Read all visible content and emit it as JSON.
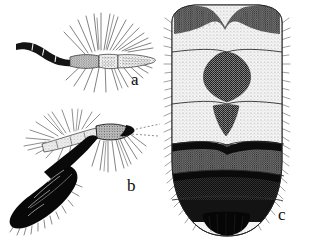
{
  "plate": {
    "title": "Entomological figure plate",
    "background_color": "#ffffff",
    "ink_color": "#111111",
    "width": 316,
    "height": 240,
    "style": "stippled pen-and-ink scientific illustration, grayscale"
  },
  "panels": [
    {
      "label": "a",
      "label_x": 131,
      "label_y": 80,
      "name": "figure-a-palpus",
      "description": "Lateral view of a maxillary palpus / antenna: dark curved segmented basal portion at left, pale grey stippled swollen segment, followed by two narrow pale segments bearing long radiating bristles directed upward and downward.",
      "bbox": [
        14,
        12,
        148,
        78
      ],
      "colors": {
        "dark": "#131313",
        "mid": "#6e6e6e",
        "pale": "#d8d8d8"
      }
    },
    {
      "label": "b",
      "label_x": 127,
      "label_y": 186,
      "name": "figure-b-palpus-dark",
      "description": "Angled palpus with very black elongate terminal lobe pointing down-left, a bent dark shaft, a grey stippled oval segment at the bend, and a slender pale flagellum with long fine hairs extending upper-left; a fan of fine hairs radiates below the oval segment.",
      "bbox": [
        14,
        110,
        150,
        228
      ],
      "colors": {
        "dark": "#0a0a0a",
        "mid": "#707070",
        "pale": "#cfcfcf"
      }
    },
    {
      "label": "c",
      "label_x": 278,
      "label_y": 215,
      "name": "figure-c-abdomen",
      "description": "Dorsal view of an abdomen, roughly rectangular, with seven visible segments separated by transverse lines and fringed laterally with fine hairs. Segment 1 bears a dark bilobed (notched, heart-shaped) band at the anterior margin; segment 2 bears a large dark diamond/spade-shaped median spot; segment 3 bears a small dark inverted triangle; segments 4-5 are medium grey with solid black anterior bands; segments 6-7 are nearly solid black with a rounded black terminal lobe.",
      "bbox": [
        168,
        5,
        298,
        236
      ],
      "segments": [
        {
          "index": 1,
          "name": "segment-1",
          "tone": "light",
          "marking": "bilobed-notched-dark-band"
        },
        {
          "index": 2,
          "name": "segment-2",
          "tone": "light",
          "marking": "diamond-median-spot"
        },
        {
          "index": 3,
          "name": "segment-3",
          "tone": "light",
          "marking": "inverted-triangle-spot"
        },
        {
          "index": 4,
          "name": "segment-4",
          "tone": "medium",
          "marking": "black-anterior-band"
        },
        {
          "index": 5,
          "name": "segment-5",
          "tone": "medium-dark",
          "marking": "black-anterior-band"
        },
        {
          "index": 6,
          "name": "segment-6",
          "tone": "dark",
          "marking": "solid-black"
        },
        {
          "index": 7,
          "name": "segment-7",
          "tone": "dark",
          "marking": "rounded-black-terminal-lobe"
        }
      ],
      "colors": {
        "light": "#e8e8e8",
        "medium": "#9a9a9a",
        "dark": "#2a2a2a",
        "black": "#0b0b0b"
      }
    }
  ]
}
